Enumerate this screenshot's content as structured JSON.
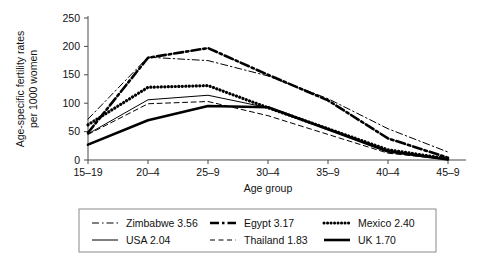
{
  "chart_data": {
    "type": "line",
    "title": "",
    "xlabel": "Age group",
    "ylabel": "Age-specific fertility rates per 1000 women",
    "ylabel_line1": "Age-specific fertility rates",
    "ylabel_line2": "per 1000 women",
    "categories": [
      "15–19",
      "20–4",
      "25–9",
      "30–4",
      "35–9",
      "40–4",
      "45–9"
    ],
    "ylim": [
      0,
      250
    ],
    "yticks": [
      0,
      50,
      100,
      150,
      200,
      250
    ],
    "ytick_labels": [
      "0",
      "50",
      "100",
      "150",
      "200",
      "250"
    ],
    "grid": false,
    "legend_position": "bottom",
    "series": [
      {
        "name": "Zimbabwe 3.56",
        "label": "Zimbabwe 3.56",
        "country": "Zimbabwe",
        "tfr": "3.56",
        "style": "dash-dot",
        "width": "thin",
        "values": [
          72,
          181,
          175,
          148,
          108,
          55,
          14
        ]
      },
      {
        "name": "Egypt 3.17",
        "label": "Egypt 3.17",
        "country": "Egypt",
        "tfr": "3.17",
        "style": "dash-dot",
        "width": "thick",
        "values": [
          48,
          180,
          197,
          150,
          105,
          38,
          4
        ]
      },
      {
        "name": "Mexico 2.40",
        "label": "Mexico 2.40",
        "country": "Mexico",
        "tfr": "2.40",
        "style": "dotted",
        "width": "thick",
        "values": [
          62,
          128,
          131,
          92,
          55,
          18,
          2
        ]
      },
      {
        "name": "USA 2.04",
        "label": "USA 2.04",
        "country": "USA",
        "tfr": "2.04",
        "style": "solid",
        "width": "thin",
        "values": [
          46,
          106,
          114,
          92,
          55,
          17,
          2
        ]
      },
      {
        "name": "Thailand 1.83",
        "label": "Thailand 1.83",
        "country": "Thailand",
        "tfr": "1.83",
        "style": "dashed",
        "width": "thin",
        "values": [
          45,
          99,
          103,
          78,
          45,
          12,
          1
        ]
      },
      {
        "name": "UK 1.70",
        "label": "UK 1.70",
        "country": "UK",
        "tfr": "1.70",
        "style": "solid",
        "width": "thick",
        "values": [
          27,
          70,
          95,
          93,
          54,
          15,
          1
        ]
      }
    ]
  },
  "legend": {
    "entries": [
      {
        "label": "Zimbabwe 3.56"
      },
      {
        "label": "Egypt 3.17"
      },
      {
        "label": "Mexico 2.40"
      },
      {
        "label": "USA 2.04"
      },
      {
        "label": "Thailand 1.83"
      },
      {
        "label": "UK 1.70"
      }
    ]
  }
}
